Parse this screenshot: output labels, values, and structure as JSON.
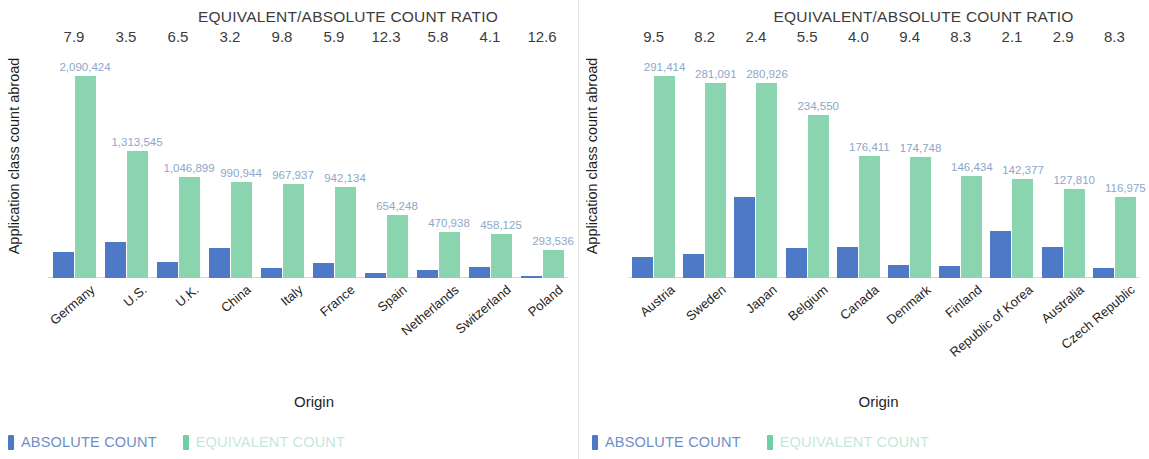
{
  "colors": {
    "absolute": "#4d79c7",
    "equivalent": "#8ad5b0",
    "value_label": "#8da7c9",
    "text": "#1f1f1f"
  },
  "legend": {
    "absolute_label": "ABSOLUTE COUNT",
    "equivalent_label": "EQUIVALENT COUNT"
  },
  "axis": {
    "y_label": "Application class count abroad",
    "x_label": "Origin",
    "ratio_title": "EQUIVALENT/ABSOLUTE COUNT RATIO"
  },
  "chart_data": [
    {
      "type": "bar",
      "title": "EQUIVALENT/ABSOLUTE COUNT RATIO",
      "xlabel": "Origin",
      "ylabel": "Application class count abroad",
      "grid": false,
      "legend_position": "bottom-left",
      "ylim": [
        0,
        2090424
      ],
      "categories": [
        "Germany",
        "U.S.",
        "U.K.",
        "China",
        "Italy",
        "France",
        "Spain",
        "Netherlands",
        "Switzerland",
        "Poland"
      ],
      "ratios": [
        "7.9",
        "3.5",
        "6.5",
        "3.2",
        "9.8",
        "5.9",
        "12.3",
        "5.8",
        "4.1",
        "12.6"
      ],
      "series": [
        {
          "name": "ABSOLUTE COUNT",
          "color": "#4d79c7",
          "values": [
            264611,
            375298,
            161062,
            309670,
            98769,
            159684,
            53191,
            81196,
            111738,
            23296
          ]
        },
        {
          "name": "EQUIVALENT COUNT",
          "color": "#8ad5b0",
          "values": [
            2090424,
            1313545,
            1046899,
            990944,
            967937,
            942134,
            654248,
            470938,
            458125,
            293536
          ],
          "labels": [
            "2,090,424",
            "1,313,545",
            "1,046,899",
            "990,944",
            "967,937",
            "942,134",
            "654,248",
            "470,938",
            "458,125",
            "293,536"
          ]
        }
      ]
    },
    {
      "type": "bar",
      "title": "EQUIVALENT/ABSOLUTE COUNT RATIO",
      "xlabel": "Origin",
      "ylabel": "Application class count abroad",
      "grid": false,
      "legend_position": "bottom-left",
      "ylim": [
        0,
        291414
      ],
      "categories": [
        "Austria",
        "Sweden",
        "Japan",
        "Belgium",
        "Canada",
        "Denmark",
        "Finland",
        "Republic of Korea",
        "Australia",
        "Czech Republic"
      ],
      "ratios": [
        "9.5",
        "8.2",
        "2.4",
        "5.5",
        "4.0",
        "9.4",
        "8.3",
        "2.1",
        "2.9",
        "8.3"
      ],
      "series": [
        {
          "name": "ABSOLUTE COUNT",
          "color": "#4d79c7",
          "values": [
            30675,
            34279,
            117052,
            42645,
            44103,
            18590,
            17643,
            67799,
            44072,
            14094
          ]
        },
        {
          "name": "EQUIVALENT COUNT",
          "color": "#8ad5b0",
          "values": [
            291414,
            281091,
            280926,
            234550,
            176411,
            174748,
            146434,
            142377,
            127810,
            116975
          ],
          "labels": [
            "291,414",
            "281,091",
            "280,926",
            "234,550",
            "176,411",
            "174,748",
            "146,434",
            "142,377",
            "127,810",
            "116,975"
          ]
        }
      ]
    }
  ]
}
